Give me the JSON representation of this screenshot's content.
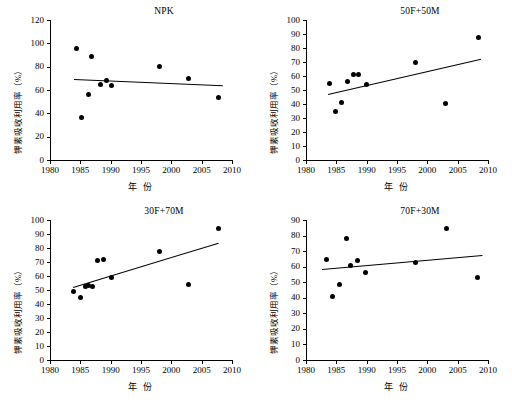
{
  "figure": {
    "width": 512,
    "height": 407,
    "background": "#ffffff",
    "marker_color": "#000000",
    "line_color": "#000000",
    "caption": ""
  },
  "chart_data": [
    {
      "type": "scatter",
      "title": "NPK",
      "xlabel": "年  份",
      "ylabel": "钾素吸收利用率（%）",
      "xlim": [
        1980,
        2010
      ],
      "ylim": [
        0,
        120
      ],
      "xticks": [
        1980,
        1985,
        1990,
        1995,
        2000,
        2005,
        2010
      ],
      "yticks": [
        0,
        20,
        40,
        60,
        80,
        100,
        120
      ],
      "grid": false,
      "legend": "none",
      "points": [
        {
          "x": 1984.3,
          "y": 95.5
        },
        {
          "x": 1985.2,
          "y": 36.5
        },
        {
          "x": 1986.3,
          "y": 56.0
        },
        {
          "x": 1986.9,
          "y": 88.3
        },
        {
          "x": 1988.3,
          "y": 64.5
        },
        {
          "x": 1989.3,
          "y": 68.5
        },
        {
          "x": 1990.2,
          "y": 63.8
        },
        {
          "x": 1998.0,
          "y": 80.5
        },
        {
          "x": 2002.9,
          "y": 69.8
        },
        {
          "x": 2007.7,
          "y": 53.8
        }
      ],
      "trend": {
        "x1": 1984.0,
        "y1": 69.3,
        "x2": 2008.6,
        "y2": 64.0,
        "slope": -0.215
      }
    },
    {
      "type": "scatter",
      "title": "50F+50M",
      "xlabel": "年  份",
      "ylabel": "钾素吸收利用率（%）",
      "xlim": [
        1980,
        2010
      ],
      "ylim": [
        0,
        100
      ],
      "xticks": [
        1980,
        1985,
        1990,
        1995,
        2000,
        2005,
        2010
      ],
      "yticks": [
        0,
        10,
        20,
        30,
        40,
        50,
        60,
        70,
        80,
        90,
        100
      ],
      "grid": false,
      "legend": "none",
      "points": [
        {
          "x": 1983.9,
          "y": 54.5
        },
        {
          "x": 1984.9,
          "y": 34.8
        },
        {
          "x": 1985.8,
          "y": 40.8
        },
        {
          "x": 1986.9,
          "y": 56.0
        },
        {
          "x": 1987.8,
          "y": 61.0
        },
        {
          "x": 1988.6,
          "y": 61.2
        },
        {
          "x": 1990.0,
          "y": 54.2
        },
        {
          "x": 1998.1,
          "y": 69.3
        },
        {
          "x": 2003.0,
          "y": 40.3
        },
        {
          "x": 2008.4,
          "y": 87.3
        }
      ],
      "trend": {
        "x1": 1983.6,
        "y1": 47.0,
        "x2": 2008.8,
        "y2": 72.2,
        "slope": 1.0
      }
    },
    {
      "type": "scatter",
      "title": "30F+70M",
      "xlabel": "年  份",
      "ylabel": "钾素吸收利用率（%）",
      "xlim": [
        1980,
        2010
      ],
      "ylim": [
        0,
        100
      ],
      "xticks": [
        1980,
        1985,
        1990,
        1995,
        2000,
        2005,
        2010
      ],
      "yticks": [
        0,
        10,
        20,
        30,
        40,
        50,
        60,
        70,
        80,
        90,
        100
      ],
      "grid": false,
      "legend": "none",
      "points": [
        {
          "x": 1983.9,
          "y": 49.0
        },
        {
          "x": 1985.0,
          "y": 44.8
        },
        {
          "x": 1985.9,
          "y": 52.5
        },
        {
          "x": 1986.3,
          "y": 53.0
        },
        {
          "x": 1987.0,
          "y": 52.3
        },
        {
          "x": 1987.9,
          "y": 70.8
        },
        {
          "x": 1988.8,
          "y": 72.0
        },
        {
          "x": 1990.1,
          "y": 59.2
        },
        {
          "x": 1998.0,
          "y": 77.8
        },
        {
          "x": 2002.8,
          "y": 53.8
        },
        {
          "x": 2007.7,
          "y": 93.8
        }
      ],
      "trend": {
        "x1": 1983.8,
        "y1": 51.8,
        "x2": 2007.8,
        "y2": 83.5,
        "slope": 1.32
      }
    },
    {
      "type": "scatter",
      "title": "70F+30M",
      "xlabel": "年  份",
      "ylabel": "钾素吸收利用率（%）",
      "xlim": [
        1980,
        2010
      ],
      "ylim": [
        0,
        90
      ],
      "xticks": [
        1980,
        1985,
        1990,
        1995,
        2000,
        2005,
        2010
      ],
      "yticks": [
        0,
        10,
        20,
        30,
        40,
        50,
        60,
        70,
        80,
        90
      ],
      "grid": false,
      "legend": "none",
      "points": [
        {
          "x": 1983.4,
          "y": 64.8
        },
        {
          "x": 1984.3,
          "y": 41.0
        },
        {
          "x": 1985.5,
          "y": 48.8
        },
        {
          "x": 1986.6,
          "y": 78.3
        },
        {
          "x": 1987.4,
          "y": 60.5
        },
        {
          "x": 1988.5,
          "y": 64.0
        },
        {
          "x": 1989.8,
          "y": 56.3
        },
        {
          "x": 1998.0,
          "y": 63.0
        },
        {
          "x": 2003.1,
          "y": 84.8
        },
        {
          "x": 2008.2,
          "y": 53.3
        }
      ],
      "trend": {
        "x1": 1982.6,
        "y1": 58.2,
        "x2": 2009.0,
        "y2": 67.2,
        "slope": 0.34
      }
    }
  ]
}
